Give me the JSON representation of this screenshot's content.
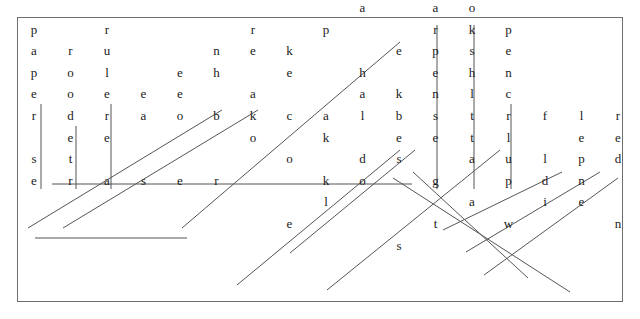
{
  "page": {
    "background_color": "#ffffff",
    "border_color": "#6d6d6d",
    "letter_color": "#1b1b1b",
    "line_color": "#555555"
  },
  "grid": {
    "origin_x": 34,
    "origin_y": 116,
    "cell_width": 36.5,
    "cell_height": 21.6,
    "rows": 11,
    "cols": 16,
    "note": "Sparse word-search grid; only cells belonging to solved words are printed."
  },
  "letters": [
    {
      "id": "L001",
      "char": "s",
      "col": 11,
      "row": 0
    },
    {
      "id": "L002",
      "char": "b",
      "col": 12,
      "row": 0
    },
    {
      "id": "L003",
      "char": "k",
      "col": 10,
      "row": 1
    },
    {
      "id": "L004",
      "char": "h",
      "col": 11,
      "row": 1
    },
    {
      "id": "L005",
      "char": "o",
      "col": 12,
      "row": 1
    },
    {
      "id": "L006",
      "char": "a",
      "col": 9,
      "row": 2
    },
    {
      "id": "L007",
      "char": "a",
      "col": 11,
      "row": 2
    },
    {
      "id": "L008",
      "char": "o",
      "col": 12,
      "row": 2
    },
    {
      "id": "L009",
      "char": "p",
      "col": 0,
      "row": 3
    },
    {
      "id": "L010",
      "char": "r",
      "col": 2,
      "row": 3
    },
    {
      "id": "L011",
      "char": "r",
      "col": 6,
      "row": 3
    },
    {
      "id": "L012",
      "char": "p",
      "col": 8,
      "row": 3
    },
    {
      "id": "L013",
      "char": "r",
      "col": 11,
      "row": 3
    },
    {
      "id": "L014",
      "char": "k",
      "col": 12,
      "row": 3
    },
    {
      "id": "L015",
      "char": "p",
      "col": 13,
      "row": 3
    },
    {
      "id": "L016",
      "char": "a",
      "col": 0,
      "row": 4
    },
    {
      "id": "L017",
      "char": "r",
      "col": 1,
      "row": 4
    },
    {
      "id": "L018",
      "char": "u",
      "col": 2,
      "row": 4
    },
    {
      "id": "L019",
      "char": "n",
      "col": 5,
      "row": 4
    },
    {
      "id": "L020",
      "char": "e",
      "col": 6,
      "row": 4
    },
    {
      "id": "L021",
      "char": "k",
      "col": 7,
      "row": 4
    },
    {
      "id": "L022",
      "char": "e",
      "col": 10,
      "row": 4
    },
    {
      "id": "L023",
      "char": "p",
      "col": 11,
      "row": 4
    },
    {
      "id": "L024",
      "char": "s",
      "col": 12,
      "row": 4
    },
    {
      "id": "L025",
      "char": "e",
      "col": 13,
      "row": 4
    },
    {
      "id": "L026",
      "char": "p",
      "col": 0,
      "row": 5
    },
    {
      "id": "L027",
      "char": "o",
      "col": 1,
      "row": 5
    },
    {
      "id": "L028",
      "char": "l",
      "col": 2,
      "row": 5
    },
    {
      "id": "L029",
      "char": "e",
      "col": 4,
      "row": 5
    },
    {
      "id": "L030",
      "char": "h",
      "col": 5,
      "row": 5
    },
    {
      "id": "L031",
      "char": "e",
      "col": 7,
      "row": 5
    },
    {
      "id": "L032",
      "char": "h",
      "col": 9,
      "row": 5
    },
    {
      "id": "L033",
      "char": "e",
      "col": 11,
      "row": 5
    },
    {
      "id": "L034",
      "char": "h",
      "col": 12,
      "row": 5
    },
    {
      "id": "L035",
      "char": "n",
      "col": 13,
      "row": 5
    },
    {
      "id": "L036",
      "char": "e",
      "col": 0,
      "row": 6
    },
    {
      "id": "L037",
      "char": "o",
      "col": 1,
      "row": 6
    },
    {
      "id": "L038",
      "char": "e",
      "col": 2,
      "row": 6
    },
    {
      "id": "L039",
      "char": "e",
      "col": 3,
      "row": 6
    },
    {
      "id": "L040",
      "char": "e",
      "col": 4,
      "row": 6
    },
    {
      "id": "L041",
      "char": "a",
      "col": 6,
      "row": 6
    },
    {
      "id": "L042",
      "char": "a",
      "col": 9,
      "row": 6
    },
    {
      "id": "L043",
      "char": "k",
      "col": 10,
      "row": 6
    },
    {
      "id": "L044",
      "char": "n",
      "col": 11,
      "row": 6
    },
    {
      "id": "L045",
      "char": "l",
      "col": 12,
      "row": 6
    },
    {
      "id": "L046",
      "char": "c",
      "col": 13,
      "row": 6
    },
    {
      "id": "L047",
      "char": "r",
      "col": 0,
      "row": 7
    },
    {
      "id": "L048",
      "char": "d",
      "col": 1,
      "row": 7
    },
    {
      "id": "L049",
      "char": "r",
      "col": 2,
      "row": 7
    },
    {
      "id": "L050",
      "char": "a",
      "col": 3,
      "row": 7
    },
    {
      "id": "L051",
      "char": "o",
      "col": 4,
      "row": 7
    },
    {
      "id": "L052",
      "char": "b",
      "col": 5,
      "row": 7
    },
    {
      "id": "L053",
      "char": "k",
      "col": 6,
      "row": 7
    },
    {
      "id": "L054",
      "char": "c",
      "col": 7,
      "row": 7
    },
    {
      "id": "L055",
      "char": "a",
      "col": 8,
      "row": 7
    },
    {
      "id": "L056",
      "char": "l",
      "col": 9,
      "row": 7
    },
    {
      "id": "L057",
      "char": "b",
      "col": 10,
      "row": 7
    },
    {
      "id": "L058",
      "char": "s",
      "col": 11,
      "row": 7
    },
    {
      "id": "L059",
      "char": "t",
      "col": 12,
      "row": 7
    },
    {
      "id": "L060",
      "char": "r",
      "col": 13,
      "row": 7
    },
    {
      "id": "L061",
      "char": "f",
      "col": 14,
      "row": 7
    },
    {
      "id": "L062",
      "char": "l",
      "col": 15,
      "row": 7
    },
    {
      "id": "L063",
      "char": "e",
      "col": 1,
      "row": 8
    },
    {
      "id": "L064",
      "char": "e",
      "col": 2,
      "row": 8
    },
    {
      "id": "L065",
      "char": "o",
      "col": 6,
      "row": 8
    },
    {
      "id": "L066",
      "char": "k",
      "col": 8,
      "row": 8
    },
    {
      "id": "L067",
      "char": "e",
      "col": 10,
      "row": 8
    },
    {
      "id": "L068",
      "char": "e",
      "col": 11,
      "row": 8
    },
    {
      "id": "L069",
      "char": "t",
      "col": 12,
      "row": 8
    },
    {
      "id": "L070",
      "char": "l",
      "col": 13,
      "row": 8
    },
    {
      "id": "L071",
      "char": "s",
      "col": 0,
      "row": 9
    },
    {
      "id": "L072",
      "char": "t",
      "col": 1,
      "row": 9
    },
    {
      "id": "L073",
      "char": "o",
      "col": 7,
      "row": 9
    },
    {
      "id": "L074",
      "char": "d",
      "col": 9,
      "row": 9
    },
    {
      "id": "L075",
      "char": "s",
      "col": 10,
      "row": 9
    },
    {
      "id": "L076",
      "char": "a",
      "col": 12,
      "row": 9
    },
    {
      "id": "L077",
      "char": "u",
      "col": 13,
      "row": 9
    },
    {
      "id": "L078",
      "char": "e",
      "col": 0,
      "row": 10
    },
    {
      "id": "L079",
      "char": "r",
      "col": 1,
      "row": 10
    },
    {
      "id": "L080",
      "char": "a",
      "col": 2,
      "row": 10
    },
    {
      "id": "L081",
      "char": "s",
      "col": 3,
      "row": 10
    },
    {
      "id": "L082",
      "char": "e",
      "col": 4,
      "row": 10
    },
    {
      "id": "L083",
      "char": "r",
      "col": 5,
      "row": 10
    },
    {
      "id": "L084",
      "char": "k",
      "col": 8,
      "row": 10
    },
    {
      "id": "L085",
      "char": "o",
      "col": 9,
      "row": 10
    },
    {
      "id": "L086",
      "char": "g",
      "col": 11,
      "row": 10
    },
    {
      "id": "L087",
      "char": "p",
      "col": 13,
      "row": 10
    },
    {
      "id": "L088",
      "char": "l",
      "col": 8,
      "row": 11
    },
    {
      "id": "L089",
      "char": "a",
      "col": 12,
      "row": 11
    },
    {
      "id": "L090",
      "char": "e",
      "col": 7,
      "row": 12
    },
    {
      "id": "L091",
      "char": "t",
      "col": 11,
      "row": 12
    },
    {
      "id": "L092",
      "char": "s",
      "col": 10,
      "row": 13
    },
    {
      "id": "L093",
      "char": "r",
      "col": 16,
      "row": 7
    },
    {
      "id": "L094",
      "char": "n",
      "col": 17,
      "row": 7
    },
    {
      "id": "L095",
      "char": "w",
      "col": 18,
      "row": 7
    },
    {
      "id": "L096",
      "char": "e",
      "col": 15,
      "row": 8
    },
    {
      "id": "L097",
      "char": "e",
      "col": 16,
      "row": 8
    },
    {
      "id": "L098",
      "char": "o",
      "col": 17,
      "row": 8
    },
    {
      "id": "L099",
      "char": "l",
      "col": 14,
      "row": 9
    },
    {
      "id": "L100",
      "char": "p",
      "col": 15,
      "row": 9
    },
    {
      "id": "L101",
      "char": "d",
      "col": 16,
      "row": 9
    },
    {
      "id": "L102",
      "char": "d",
      "col": 14,
      "row": 10
    },
    {
      "id": "L103",
      "char": "n",
      "col": 15,
      "row": 10
    },
    {
      "id": "L104",
      "char": "i",
      "col": 14,
      "row": 11
    },
    {
      "id": "L105",
      "char": "e",
      "col": 15,
      "row": 11
    },
    {
      "id": "L106",
      "char": "w",
      "col": 13,
      "row": 12
    },
    {
      "id": "L107",
      "char": "n",
      "col": 16,
      "row": 12
    },
    {
      "id": "L108",
      "char": "t",
      "col": 17,
      "row": 13
    }
  ],
  "solution_lines": [
    {
      "id": "W01",
      "word": "blackboard",
      "display": "draobkcalb",
      "direction": "horizontal",
      "x1": 52,
      "y1": 184,
      "x2": 412,
      "y2": 184
    },
    {
      "id": "W02",
      "word": "eraser",
      "display": "eraser",
      "direction": "horizontal",
      "x1": 35,
      "y1": 238,
      "x2": 187,
      "y2": 238
    },
    {
      "id": "W03",
      "word": "paper",
      "display": "paper",
      "direction": "vertical",
      "x1": 41,
      "y1": 104,
      "x2": 41,
      "y2": 189
    },
    {
      "id": "W04",
      "word": "rood",
      "display": "rood",
      "direction": "vertical",
      "x1": 76,
      "y1": 126,
      "x2": 76,
      "y2": 189
    },
    {
      "id": "W05",
      "word": "ruler",
      "display": "ruler",
      "direction": "vertical",
      "x1": 111,
      "y1": 104,
      "x2": 111,
      "y2": 189
    },
    {
      "id": "W06",
      "word": "sharpener",
      "display": "sharpener",
      "direction": "vertical",
      "x1": 437,
      "y1": 25,
      "x2": 437,
      "y2": 189
    },
    {
      "id": "W07",
      "word": "bookshelf",
      "display": "bookshelf",
      "direction": "vertical",
      "x1": 474,
      "y1": 25,
      "x2": 474,
      "y2": 189
    },
    {
      "id": "W08",
      "word": "pencil",
      "display": "pencil",
      "direction": "vertical",
      "x1": 511,
      "y1": 104,
      "x2": 511,
      "y2": 189
    },
    {
      "id": "W09",
      "word": "teacher",
      "display": "rehcaet",
      "direction": "diagonal-up",
      "x1": 28,
      "y1": 228,
      "x2": 222,
      "y2": 110
    },
    {
      "id": "W10",
      "word": "notebook",
      "display": "koobeton",
      "direction": "diagonal-up",
      "x1": 63,
      "y1": 228,
      "x2": 258,
      "y2": 110
    },
    {
      "id": "W11",
      "word": "backpack",
      "display": "kcapkcab",
      "direction": "diagonal-up",
      "x1": 182,
      "y1": 228,
      "x2": 400,
      "y2": 42
    },
    {
      "id": "W12",
      "word": "eraser2",
      "display": "letters",
      "direction": "diagonal-up",
      "x1": 237,
      "y1": 285,
      "x2": 400,
      "y2": 150
    },
    {
      "id": "W13",
      "word": "desk",
      "display": "desk",
      "direction": "diagonal-up",
      "x1": 290,
      "y1": 253,
      "x2": 415,
      "y2": 150
    },
    {
      "id": "W14",
      "word": "glue",
      "display": "glue",
      "direction": "diagonal-up",
      "x1": 327,
      "y1": 290,
      "x2": 500,
      "y2": 150
    },
    {
      "id": "W15",
      "word": "bookshelf2",
      "display": "diag",
      "direction": "diagonal-down",
      "x1": 413,
      "y1": 172,
      "x2": 528,
      "y2": 278
    },
    {
      "id": "W16",
      "word": "student",
      "display": "student",
      "direction": "diagonal-down",
      "x1": 393,
      "y1": 178,
      "x2": 570,
      "y2": 292
    },
    {
      "id": "W17",
      "word": "crayon",
      "display": "crayon",
      "direction": "diagonal-up",
      "x1": 443,
      "y1": 230,
      "x2": 562,
      "y2": 172
    },
    {
      "id": "W18",
      "word": "pen",
      "display": "pen",
      "direction": "diagonal-up",
      "x1": 466,
      "y1": 252,
      "x2": 600,
      "y2": 172
    },
    {
      "id": "W19",
      "word": "window",
      "display": "window",
      "direction": "diagonal-up",
      "x1": 484,
      "y1": 275,
      "x2": 618,
      "y2": 178
    }
  ]
}
